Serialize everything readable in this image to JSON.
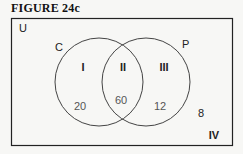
{
  "figure": {
    "title": "FIGURE 24c",
    "universe_label": "U",
    "sets": [
      {
        "name": "C"
      },
      {
        "name": "P"
      }
    ],
    "regions": [
      {
        "roman": "I",
        "value": "20"
      },
      {
        "roman": "II",
        "value": "60"
      },
      {
        "roman": "III",
        "value": "12"
      },
      {
        "roman": "IV",
        "value": "8"
      }
    ]
  }
}
